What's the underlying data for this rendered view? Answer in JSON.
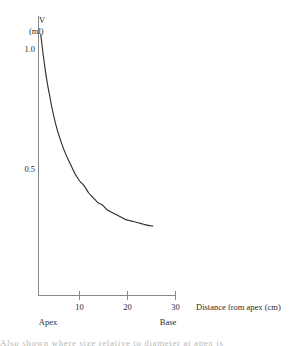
{
  "figure": {
    "name": "volume-vs-distance-from-apex-graph",
    "background_color": "#ffffff",
    "axis_color": "#8a8a8a",
    "curve_color": "#2e2e2e"
  },
  "caption": {
    "cropped_text_fragment": "Also shown where size relative to diameter at apex is"
  },
  "chart_data": {
    "type": "line",
    "title": "",
    "subtitle": "",
    "xlabel": "Distance from apex (cm)",
    "ylabel": "V",
    "ylabel_units": "(ml)",
    "xlim": [
      0,
      30
    ],
    "ylim": [
      0,
      1.12
    ],
    "grid": false,
    "legend": null,
    "x_ticks": [
      10,
      20,
      30
    ],
    "x_tick_labels": [
      "10",
      "20",
      "30"
    ],
    "y_ticks": [
      0.5,
      1.0
    ],
    "y_tick_labels": [
      "0.5",
      "1.0"
    ],
    "annotations": [
      {
        "text": "Apex",
        "x": 0.5,
        "position": "below-axis-left"
      },
      {
        "text": "Base",
        "x": 25.0,
        "position": "below-axis-right"
      }
    ],
    "series": [
      {
        "name": "V",
        "x": [
          0.5,
          1.0,
          1.5,
          2.0,
          2.5,
          3.0,
          4.0,
          5.0,
          6.0,
          7.0,
          8.0,
          9.0,
          10.0,
          11.0,
          12.0,
          13.0,
          14.0,
          15.0,
          16.0,
          17.0,
          18.0,
          19.0,
          20.0,
          21.0,
          22.0,
          23.0,
          24.0,
          25.0
        ],
        "y": [
          1.06,
          0.98,
          0.91,
          0.85,
          0.8,
          0.75,
          0.67,
          0.61,
          0.56,
          0.52,
          0.48,
          0.45,
          0.43,
          0.4,
          0.38,
          0.36,
          0.35,
          0.33,
          0.32,
          0.31,
          0.3,
          0.29,
          0.285,
          0.28,
          0.275,
          0.27,
          0.265,
          0.262
        ]
      }
    ]
  }
}
